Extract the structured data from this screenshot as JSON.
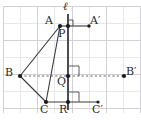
{
  "figure": {
    "canvas": {
      "width": 141,
      "height": 120
    },
    "colors": {
      "grid_minor": "#e6e4e8",
      "grid_major": "#cfcdd3",
      "line_of_reflection": "#3a3a3a",
      "triangle_stroke": "#3a3a3a",
      "dashed_segment": "#6a6a6a",
      "point_fill": "#1a1a1a",
      "label_text": "#2b2b2b",
      "background": "#ffffff"
    },
    "grid": {
      "spacing": 17,
      "origin_x": 3,
      "origin_y": 6,
      "columns": 8,
      "rows": 6
    }
  },
  "labels": {
    "line_l": "ℓ",
    "A": "A",
    "A_prime": "A′",
    "B": "B",
    "B_prime": "B′",
    "C": "C",
    "C_prime": "C′",
    "P": "P",
    "Q": "Q",
    "R": "R"
  },
  "points": [
    {
      "name": "A",
      "label": "A",
      "x": 60,
      "y": 26,
      "label_x": 46,
      "label_y": 17,
      "drawn": true
    },
    {
      "name": "A_prime",
      "label": "A′",
      "x": 89,
      "y": 26,
      "label_x": 91,
      "label_y": 17,
      "drawn": true
    },
    {
      "name": "B",
      "label": "B",
      "x": 20,
      "y": 76,
      "label_x": 6,
      "label_y": 67,
      "drawn": true
    },
    {
      "name": "B_prime",
      "label": "B′",
      "x": 124,
      "y": 76,
      "label_x": 126,
      "label_y": 67,
      "drawn": true
    },
    {
      "name": "C",
      "label": "C",
      "x": 46,
      "y": 102,
      "label_x": 41,
      "label_y": 104,
      "drawn": true
    },
    {
      "name": "C_prime",
      "label": "C′",
      "x": 98,
      "y": 102,
      "label_x": 93,
      "label_y": 104,
      "drawn": true
    },
    {
      "name": "P",
      "label": "P",
      "x": 68,
      "y": 26,
      "label_x": 59,
      "label_y": 28,
      "drawn": true
    },
    {
      "name": "Q",
      "label": "Q",
      "x": 68,
      "y": 76,
      "label_x": 58,
      "label_y": 78,
      "drawn": true
    },
    {
      "name": "R",
      "label": "R",
      "x": 68,
      "y": 102,
      "label_x": 60,
      "label_y": 104,
      "drawn": true
    }
  ],
  "line_of_reflection": {
    "name": "line-l",
    "label": "ℓ",
    "x": 68,
    "y1": 14,
    "y2": 110,
    "label_x": 64,
    "label_y": 2
  },
  "triangle": {
    "name": "triangle-ABC",
    "vertices": [
      "A",
      "B",
      "C"
    ],
    "path": "M60,26 L20,76 L46,102 Z"
  },
  "segments": [
    {
      "name": "segment-A-Aprime",
      "from": "A",
      "to": "A′",
      "style": "solid",
      "path": "M60,26 L89,26"
    },
    {
      "name": "segment-B-Bprime",
      "from": "B",
      "to": "B′",
      "style": "dashed",
      "path": "M20,76 L124,76"
    },
    {
      "name": "segment-C-Cprime",
      "from": "C",
      "to": "C′",
      "style": "solid",
      "path": "M46,102 L98,102"
    }
  ],
  "right_angle_marks": [
    {
      "name": "right-angle-at-P",
      "path": "M72,26 L72,21 L68,21"
    },
    {
      "name": "right-angle-at-Q",
      "path": "M78,76 L78,65 L68,65"
    },
    {
      "name": "right-angle-at-R",
      "path": "M78,102 L78,91 L68,91"
    }
  ]
}
